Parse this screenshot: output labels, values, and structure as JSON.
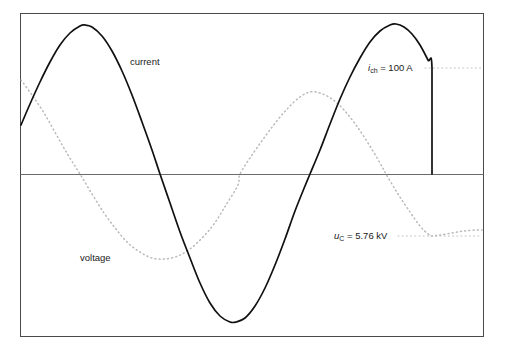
{
  "figure": {
    "name": "capacitor-discharge-waveform-diagram",
    "background_color": "#ffffff",
    "frame": {
      "x": 20,
      "y": 13,
      "width": 463,
      "height": 323,
      "stroke_color": "#4a4a4a"
    },
    "zero_axis": {
      "y": 174,
      "x1": 20,
      "x2": 483,
      "stroke_color": "#6b6b6b"
    }
  },
  "labels": {
    "current": "current",
    "voltage": "voltage",
    "current_peak_symbol": "i",
    "current_peak_subscript": "ch",
    "current_peak_value": " = 100 A",
    "voltage_symbol": "u",
    "voltage_subscript": "C",
    "voltage_value": " = 5.76 kV"
  },
  "colors": {
    "current_stroke": "#111111",
    "voltage_stroke": "#b9b9b9",
    "leader_stroke": "#c3c3c3",
    "frame_stroke": "#4a4a4a",
    "axis_stroke": "#6b6b6b"
  },
  "chart_data": {
    "type": "line",
    "title": "",
    "xlabel": "",
    "ylabel": "",
    "grid": false,
    "legend_position": "inline-annotations",
    "axis_ranges": {
      "x": [
        20,
        483
      ],
      "y_pixels": [
        13,
        336
      ],
      "zero_y_pixel": 174
    },
    "annotations": [
      {
        "text": "current",
        "x": 130,
        "y": 62
      },
      {
        "text": "voltage",
        "x": 80,
        "y": 258
      },
      {
        "text": "i_ch = 100 A",
        "x": 368,
        "y": 68,
        "value": 100,
        "unit": "A",
        "symbol": "i_ch"
      },
      {
        "text": "u_C = 5.76 kV",
        "x": 334,
        "y": 236,
        "value": 5.76,
        "unit": "kV",
        "symbol": "u_C"
      }
    ],
    "series": [
      {
        "name": "current",
        "style": "solid",
        "color": "#111111",
        "description": "sinusoidal current, roughly 1.75 cycles, chopped by a vertical fall to zero at the end",
        "points_px": [
          [
            21,
            125
          ],
          [
            30,
            104
          ],
          [
            40,
            82
          ],
          [
            50,
            62
          ],
          [
            60,
            45
          ],
          [
            70,
            33
          ],
          [
            80,
            26
          ],
          [
            85,
            25
          ],
          [
            92,
            27
          ],
          [
            102,
            36
          ],
          [
            112,
            51
          ],
          [
            122,
            71
          ],
          [
            132,
            95
          ],
          [
            142,
            122
          ],
          [
            152,
            150
          ],
          [
            160,
            174
          ],
          [
            170,
            203
          ],
          [
            180,
            232
          ],
          [
            190,
            258
          ],
          [
            200,
            283
          ],
          [
            210,
            303
          ],
          [
            220,
            316
          ],
          [
            230,
            322
          ],
          [
            236,
            322
          ],
          [
            245,
            318
          ],
          [
            255,
            306
          ],
          [
            265,
            288
          ],
          [
            275,
            265
          ],
          [
            285,
            239
          ],
          [
            295,
            211
          ],
          [
            305,
            186
          ],
          [
            310,
            174
          ],
          [
            320,
            150
          ],
          [
            330,
            124
          ],
          [
            340,
            99
          ],
          [
            350,
            77
          ],
          [
            360,
            58
          ],
          [
            370,
            42
          ],
          [
            380,
            31
          ],
          [
            390,
            25
          ],
          [
            396,
            24
          ],
          [
            404,
            27
          ],
          [
            412,
            34
          ],
          [
            420,
            45
          ],
          [
            428,
            60
          ],
          [
            432,
            68
          ],
          [
            432,
            174
          ]
        ]
      },
      {
        "name": "voltage",
        "style": "dotted",
        "color": "#b9b9b9",
        "description": "sinusoidal capacitor voltage lagging the current by 90 degrees, settling after the chop",
        "points_px": [
          [
            21,
            80
          ],
          [
            32,
            95
          ],
          [
            44,
            113
          ],
          [
            56,
            134
          ],
          [
            68,
            155
          ],
          [
            80,
            174
          ],
          [
            92,
            194
          ],
          [
            104,
            213
          ],
          [
            116,
            229
          ],
          [
            128,
            243
          ],
          [
            140,
            252
          ],
          [
            152,
            258
          ],
          [
            165,
            259
          ],
          [
            178,
            256
          ],
          [
            190,
            249
          ],
          [
            202,
            238
          ],
          [
            214,
            224
          ],
          [
            226,
            205
          ],
          [
            238,
            185
          ],
          [
            240,
            174
          ],
          [
            252,
            155
          ],
          [
            264,
            138
          ],
          [
            276,
            122
          ],
          [
            288,
            108
          ],
          [
            300,
            97
          ],
          [
            310,
            92
          ],
          [
            320,
            93
          ],
          [
            332,
            99
          ],
          [
            344,
            110
          ],
          [
            356,
            125
          ],
          [
            368,
            143
          ],
          [
            380,
            163
          ],
          [
            386,
            174
          ],
          [
            398,
            194
          ],
          [
            410,
            212
          ],
          [
            420,
            226
          ],
          [
            428,
            234
          ],
          [
            432,
            236
          ],
          [
            440,
            235
          ],
          [
            452,
            233
          ],
          [
            464,
            231
          ],
          [
            476,
            230
          ],
          [
            482,
            230
          ]
        ]
      }
    ],
    "leader_lines": [
      {
        "name": "current-peak-leader",
        "x1": 425,
        "y1": 68,
        "x2": 482,
        "y2": 68
      },
      {
        "name": "voltage-leader",
        "x1": 398,
        "y1": 236,
        "x2": 482,
        "y2": 236
      }
    ]
  }
}
